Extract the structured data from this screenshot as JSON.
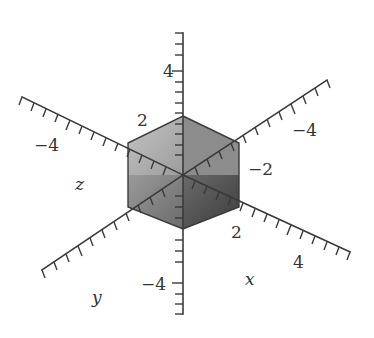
{
  "figure": {
    "type": "3d-axes-with-cube",
    "colors": {
      "background": "#ffffff",
      "axis": "#3a3a3a",
      "face_top": "#b5b5b5",
      "face_left": "#8a8a8a",
      "face_right": "#4a4a4a",
      "edge": "#3a3a3a"
    },
    "axis_labels": {
      "x": "x",
      "y": "y",
      "z": "z"
    },
    "tick_labels": {
      "vertical_pos": "4",
      "vertical_neg": "−4",
      "upper_left_2": "2",
      "upper_left_neg4": "−4",
      "upper_right_neg2": "−2",
      "upper_right_neg4": "−4",
      "lower_right_2": "2",
      "lower_right_4": "4"
    },
    "cube": {
      "description": "shaded cube centered at origin spanning approximately -2 to 2 on each axis",
      "extent": [
        -2,
        2
      ]
    },
    "axes": [
      {
        "name": "vertical",
        "range": [
          -6.5,
          6.5
        ],
        "labels": [
          "4",
          "−4"
        ]
      },
      {
        "name": "z-direction (upper-left/lower-right)",
        "labels": [
          "2",
          "−4"
        ]
      },
      {
        "name": "upper-right/lower-left",
        "labels": [
          "−2",
          "−4"
        ]
      },
      {
        "name": "x",
        "labels": [
          "2",
          "4"
        ]
      }
    ]
  }
}
